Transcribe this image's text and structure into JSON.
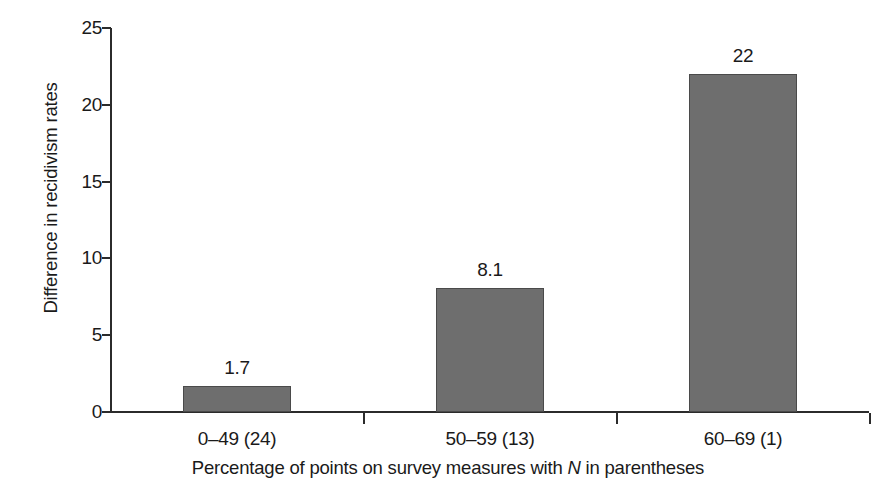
{
  "chart_data": {
    "type": "bar",
    "title": "",
    "categories": [
      "0–49 (24)",
      "50–59 (13)",
      "60–69 (1)"
    ],
    "values": [
      1.7,
      8.1,
      22
    ],
    "value_labels": [
      "1.7",
      "8.1",
      "22"
    ],
    "xlabel_parts": {
      "before": "Percentage of points on survey measures with ",
      "italic": "N",
      "after": " in parentheses"
    },
    "xlabel": "Percentage of points on survey measures with N in parentheses",
    "ylabel": "Difference in recidivism rates",
    "ylim": [
      0,
      25
    ],
    "yticks": [
      0,
      5,
      10,
      15,
      20,
      25
    ],
    "ytick_labels": [
      "0",
      "5",
      "10",
      "15",
      "20",
      "25"
    ],
    "grid": false,
    "legend": "none",
    "bar_color": "#6e6e6e",
    "bar_edge_color": "#4a4a4a",
    "axis_color": "#2b2b2b",
    "background_color": "#ffffff"
  }
}
